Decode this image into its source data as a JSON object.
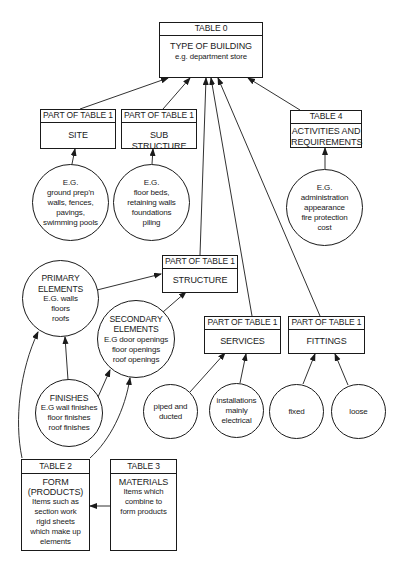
{
  "diagram": {
    "table0": {
      "header": "TABLE 0",
      "title": "TYPE OF BUILDING",
      "subtitle": "e.g. department store"
    },
    "site": {
      "header": "PART OF TABLE 1",
      "title": "SITE"
    },
    "substructure": {
      "header": "PART OF TABLE 1",
      "title": "SUB STRUCTURE"
    },
    "table4": {
      "header": "TABLE 4",
      "title_line1": "ACTIVITIES AND",
      "title_line2": "REQUIREMENTS"
    },
    "structure": {
      "header": "PART OF TABLE 1",
      "title": "STRUCTURE"
    },
    "services": {
      "header": "PART OF TABLE 1",
      "title": "SERVICES"
    },
    "fittings": {
      "header": "PART OF TABLE 1",
      "title": "FITTINGS"
    },
    "table2": {
      "header": "TABLE 2",
      "lines": [
        "FORM",
        "(PRODUCTS)",
        "Items such as",
        "section work",
        "rigid sheets",
        "which make up",
        "elements"
      ]
    },
    "table3": {
      "header": "TABLE 3",
      "lines": [
        "MATERIALS",
        "Items which",
        "combine to",
        "form products"
      ]
    },
    "circles": {
      "site_eg": [
        "E.G.",
        "ground prep'n",
        "walls, fences,",
        "pavings,",
        "swimming pools"
      ],
      "sub_eg": [
        "E.G.",
        "floor beds,",
        "retaining walls",
        "foundations",
        "piling"
      ],
      "table4_eg": [
        "E.G.",
        "administration",
        "appearance",
        "fire protection",
        "cost"
      ],
      "primary": [
        "PRIMARY",
        "ELEMENTS",
        "E.G. walls",
        "floors",
        "roofs"
      ],
      "secondary": [
        "SECONDARY",
        "ELEMENTS",
        "E.G door openings",
        "floor openings",
        "roof openings"
      ],
      "finishes": [
        "FINISHES",
        "E.G wall finishes",
        "floor finishes",
        "roof finishes"
      ],
      "piped": [
        "piped and",
        "ducted"
      ],
      "installations": [
        "installations",
        "mainly",
        "electrical"
      ],
      "fixed": [
        "fixed"
      ],
      "loose": [
        "loose"
      ]
    }
  }
}
